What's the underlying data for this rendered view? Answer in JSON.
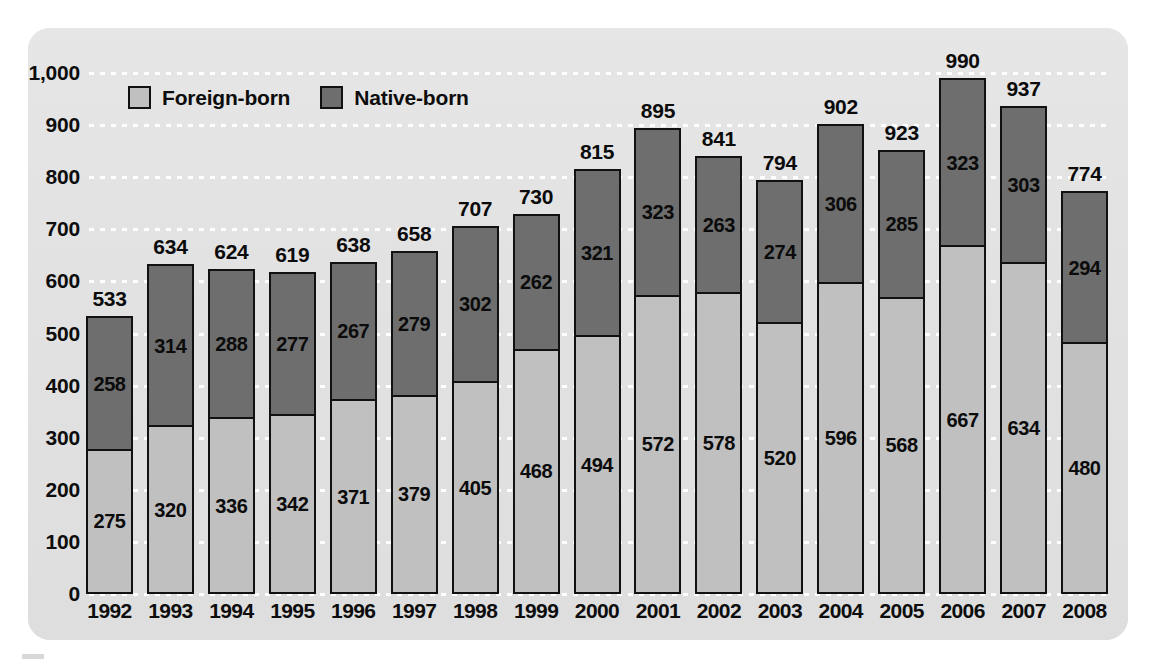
{
  "chart_data": {
    "type": "bar",
    "stacked": true,
    "title": "",
    "subtitle": "",
    "xlabel": "",
    "ylabel": "",
    "ylim": [
      0,
      1000
    ],
    "ytick_step": 100,
    "grid": true,
    "grid_style": "dotted-white-horizontal",
    "legend_position": "top-left-inside",
    "categories": [
      "1992",
      "1993",
      "1994",
      "1995",
      "1996",
      "1997",
      "1998",
      "1999",
      "2000",
      "2001",
      "2002",
      "2003",
      "2004",
      "2005",
      "2006",
      "2007",
      "2008"
    ],
    "ytick_labels": [
      "1,000",
      "900",
      "800",
      "700",
      "600",
      "500",
      "400",
      "300",
      "200",
      "100",
      "0"
    ],
    "ytick_values": [
      1000,
      900,
      800,
      700,
      600,
      500,
      400,
      300,
      200,
      100,
      0
    ],
    "series": [
      {
        "name": "Foreign-born",
        "color": "#c0c0c0",
        "stack_position": "bottom",
        "values": [
          275,
          320,
          336,
          342,
          371,
          379,
          405,
          468,
          494,
          572,
          578,
          520,
          596,
          568,
          667,
          634,
          480
        ]
      },
      {
        "name": "Native-born",
        "color": "#6e6e6e",
        "stack_position": "top",
        "values": [
          258,
          314,
          288,
          277,
          267,
          279,
          302,
          262,
          321,
          323,
          263,
          274,
          306,
          285,
          323,
          303,
          294
        ]
      }
    ],
    "totals": [
      533,
      634,
      624,
      619,
      638,
      658,
      707,
      730,
      815,
      895,
      841,
      794,
      902,
      923,
      990,
      937,
      774
    ],
    "annotations": {
      "total_labels_above_bars": true,
      "segment_value_labels": true
    }
  },
  "legend": {
    "items": [
      {
        "label": "Foreign-born",
        "color": "#c0c0c0"
      },
      {
        "label": "Native-born",
        "color": "#6e6e6e"
      }
    ]
  },
  "colors": {
    "panel_background": "#e3e3e3",
    "page_background": "#ffffff",
    "foreign_born": "#c0c0c0",
    "native_born": "#6e6e6e",
    "bar_outline": "#111111",
    "gridline": "#ffffff",
    "text": "#0d0d0d"
  }
}
